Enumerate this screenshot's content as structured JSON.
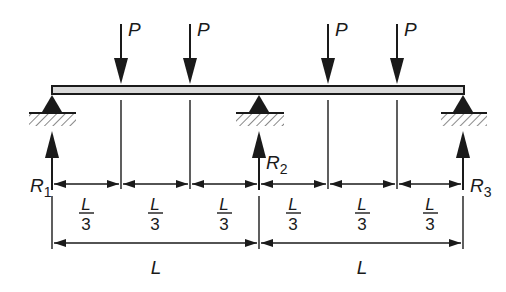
{
  "diagram": {
    "loads": [
      {
        "label": "P",
        "x": 121
      },
      {
        "label": "P",
        "x": 190
      },
      {
        "label": "P",
        "x": 328
      },
      {
        "label": "P",
        "x": 397
      }
    ],
    "reactions": [
      {
        "label": "R",
        "sub": "1",
        "x": 52
      },
      {
        "label": "R",
        "sub": "2",
        "x": 259
      },
      {
        "label": "R",
        "sub": "3",
        "x": 463
      }
    ],
    "segments": [
      {
        "num": "L",
        "den": "3"
      },
      {
        "num": "L",
        "den": "3"
      },
      {
        "num": "L",
        "den": "3"
      },
      {
        "num": "L",
        "den": "3"
      },
      {
        "num": "L",
        "den": "3"
      },
      {
        "num": "L",
        "den": "3"
      }
    ],
    "spans": [
      {
        "label": "L"
      },
      {
        "label": "L"
      }
    ],
    "colors": {
      "ink": "#1a1a1a",
      "beam_fill": "#d9d9d9"
    }
  }
}
